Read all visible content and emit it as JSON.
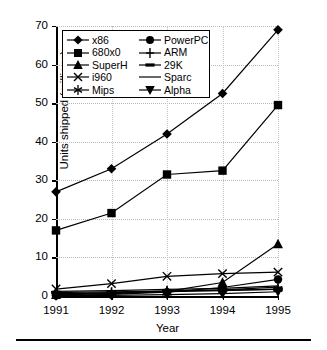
{
  "chart_data": {
    "type": "line",
    "title": "",
    "xlabel": "Year",
    "ylabel": "Units shipped (millions)",
    "categories": [
      "1991",
      "1992",
      "1993",
      "1994",
      "1995"
    ],
    "x": [
      1991,
      1992,
      1993,
      1994,
      1995
    ],
    "xlim": [
      1991,
      1995
    ],
    "ylim": [
      0,
      70
    ],
    "yticks": [
      0,
      10,
      20,
      30,
      40,
      50,
      60,
      70
    ],
    "grid": true,
    "legend_position": "top-left-inside",
    "series": [
      {
        "name": "x86",
        "marker": "diamond",
        "values": [
          27,
          33,
          42,
          52.5,
          69
        ]
      },
      {
        "name": "680x0",
        "marker": "square",
        "values": [
          17,
          21.5,
          31.5,
          32.5,
          49.5
        ]
      },
      {
        "name": "SuperH",
        "marker": "triangle-up",
        "values": [
          0.3,
          0.6,
          1.2,
          3.5,
          13.5
        ]
      },
      {
        "name": "i960",
        "marker": "x",
        "values": [
          1.8,
          3.2,
          5.1,
          5.8,
          6.2
        ]
      },
      {
        "name": "Mips",
        "marker": "asterisk",
        "values": [
          0.6,
          0.8,
          1.1,
          1.4,
          1.8
        ]
      },
      {
        "name": "PowerPC",
        "marker": "circle",
        "values": [
          0.1,
          0.4,
          1.0,
          2.2,
          4.3
        ]
      },
      {
        "name": "ARM",
        "marker": "plus",
        "values": [
          0.4,
          0.9,
          1.3,
          1.6,
          2.3
        ]
      },
      {
        "name": "29K",
        "marker": "dash",
        "values": [
          0.9,
          1.1,
          1.3,
          1.5,
          1.7
        ]
      },
      {
        "name": "Sparc",
        "marker": "none",
        "values": [
          1.2,
          1.4,
          1.7,
          2.0,
          2.6
        ]
      },
      {
        "name": "Alpha",
        "marker": "triangle-down",
        "values": [
          0.05,
          0.15,
          0.35,
          0.6,
          1.1
        ]
      }
    ]
  },
  "legend": {
    "entries": [
      {
        "label": "x86",
        "marker": "diamond"
      },
      {
        "label": "PowerPC",
        "marker": "circle"
      },
      {
        "label": "680x0",
        "marker": "square"
      },
      {
        "label": "ARM",
        "marker": "plus"
      },
      {
        "label": "SuperH",
        "marker": "triangle-up"
      },
      {
        "label": "29K",
        "marker": "dash"
      },
      {
        "label": "i960",
        "marker": "x"
      },
      {
        "label": "Sparc",
        "marker": "none"
      },
      {
        "label": "Mips",
        "marker": "asterisk"
      },
      {
        "label": "Alpha",
        "marker": "triangle-down"
      }
    ]
  },
  "colors": {
    "series": "#000000",
    "grid": "#b9b9b9",
    "axis": "#000000",
    "background": "#ffffff"
  }
}
